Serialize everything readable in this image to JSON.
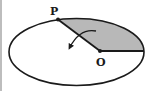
{
  "diagram": {
    "labels": {
      "point_p": "P",
      "point_o": "O"
    },
    "colors": {
      "stroke": "#1a1a1a",
      "shaded_region": "#b8b8b8",
      "background": "#ffffff",
      "frame_border": "#bdbdbd"
    },
    "elements": {
      "ellipse": "orbit-ellipse",
      "shaded_sector": "swept-area",
      "radius_line": "line-O-to-P",
      "axis_line": "line-O-to-right-vertex",
      "rotation_arrow": "curved-arrow-counterclockwise"
    }
  }
}
